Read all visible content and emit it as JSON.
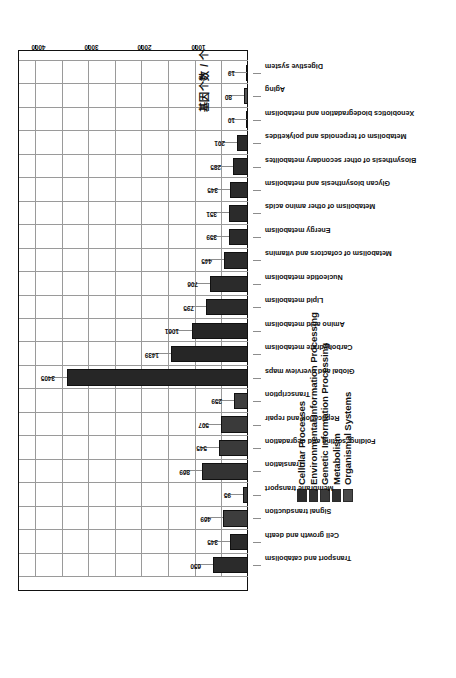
{
  "chart_data": {
    "type": "bar",
    "title": "",
    "xlabel": "",
    "ylabel": "基因个数 / 个",
    "ylim": [
      0,
      4300
    ],
    "yticks": [
      1000,
      2000,
      3000,
      4000
    ],
    "grid": true,
    "orientation": "vertical-rotated-90",
    "legend_position": "top-center",
    "legend": [
      {
        "label": "Cellular Processes",
        "color": "#2b2b2b"
      },
      {
        "label": "Environmental Information Processing",
        "color": "#323232"
      },
      {
        "label": "Genetic Information Processing",
        "color": "#3a3a3a"
      },
      {
        "label": "Metabolism",
        "color": "#303030"
      },
      {
        "label": "Organismal Systems",
        "color": "#4a4a4a"
      }
    ],
    "categories": [
      "Transport and catabolism",
      "Cell growth and death",
      "Signal transduction",
      "Membrane transport",
      "Translation",
      "Folding, sorting and degradation",
      "Replication and repair",
      "Transcription",
      "Global and overview maps",
      "Carbohydrate metabolism",
      "Amino acid metabolism",
      "Lipid metabolism",
      "Nucleotide metabolism",
      "Metabolism of cofactors and vitamins",
      "Energy metabolism",
      "Metabolism of other amino acids",
      "Glycan biosynthesis and metabolism",
      "Biosynthesis of other secondary metabolites",
      "Metabolism of terpenoids and polyketides",
      "Xenobiotics biodegradation and metabolism",
      "Aging",
      "Digestive system"
    ],
    "values": [
      650,
      345,
      469,
      95,
      869,
      545,
      507,
      259,
      3405,
      1439,
      1061,
      795,
      706,
      445,
      359,
      351,
      345,
      285,
      201,
      10,
      80,
      19
    ],
    "groups": [
      "Cellular Processes",
      "Cellular Processes",
      "Environmental Information Processing",
      "Environmental Information Processing",
      "Genetic Information Processing",
      "Genetic Information Processing",
      "Genetic Information Processing",
      "Genetic Information Processing",
      "Metabolism",
      "Metabolism",
      "Metabolism",
      "Metabolism",
      "Metabolism",
      "Metabolism",
      "Metabolism",
      "Metabolism",
      "Metabolism",
      "Metabolism",
      "Metabolism",
      "Metabolism",
      "Organismal Systems",
      "Organismal Systems"
    ],
    "bar_colors": [
      "#2b2b2b",
      "#2b2b2b",
      "#3d3d3d",
      "#3d3d3d",
      "#333333",
      "#3a3a3a",
      "#3a3a3a",
      "#3f3f3f",
      "#262626",
      "#262626",
      "#262626",
      "#2b2b2b",
      "#2b2b2b",
      "#2b2b2b",
      "#2b2b2b",
      "#2b2b2b",
      "#2b2b2b",
      "#2b2b2b",
      "#2b2b2b",
      "#2b2b2b",
      "#555555",
      "#4f4f4f"
    ]
  }
}
